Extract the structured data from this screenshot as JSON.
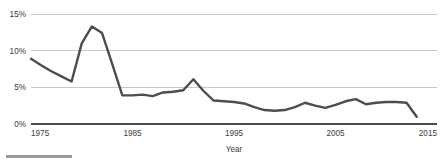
{
  "chart_data": {
    "type": "line",
    "title": "",
    "subtitle": "",
    "xlabel": "Year",
    "ylabel": "",
    "grid": "horizontal",
    "legend": "none",
    "xlim": [
      1975,
      2015
    ],
    "ylim": [
      0,
      15
    ],
    "x_ticks": [
      "1975",
      "1985",
      "1995",
      "2005",
      "2015"
    ],
    "x_tick_values": [
      1975,
      1985,
      1995,
      2005,
      2015
    ],
    "y_ticks": [
      "0%",
      "5%",
      "10%",
      "15%"
    ],
    "y_tick_values": [
      0,
      5,
      10,
      15
    ],
    "series": [
      {
        "name": "rate",
        "color": "#4d4d4d",
        "x": [
          1975,
          1976,
          1977,
          1978,
          1979,
          1980,
          1981,
          1982,
          1983,
          1984,
          1985,
          1986,
          1987,
          1988,
          1989,
          1990,
          1991,
          1992,
          1993,
          1994,
          1995,
          1996,
          1997,
          1998,
          1999,
          2000,
          2001,
          2002,
          2003,
          2004,
          2005,
          2006,
          2007,
          2008,
          2009,
          2010,
          2011,
          2012,
          2013
        ],
        "values": [
          8.9,
          8.0,
          7.2,
          6.5,
          5.8,
          11.0,
          13.3,
          12.4,
          8.2,
          3.9,
          3.9,
          4.0,
          3.8,
          4.3,
          4.4,
          4.6,
          6.1,
          4.5,
          3.2,
          3.1,
          3.0,
          2.8,
          2.3,
          1.9,
          1.8,
          1.9,
          2.3,
          2.9,
          2.5,
          2.2,
          2.6,
          3.1,
          3.4,
          2.7,
          2.9,
          3.0,
          3.0,
          2.9,
          1.0
        ]
      }
    ],
    "annotations": []
  },
  "axis": {
    "x_title": "Year"
  },
  "colors": {
    "line": "#4d4d4d",
    "gridline": "#c2c2c2",
    "baseline": "#4a4a4a",
    "text": "#3c3c3c",
    "footer_rule": "#9a9a9a"
  }
}
